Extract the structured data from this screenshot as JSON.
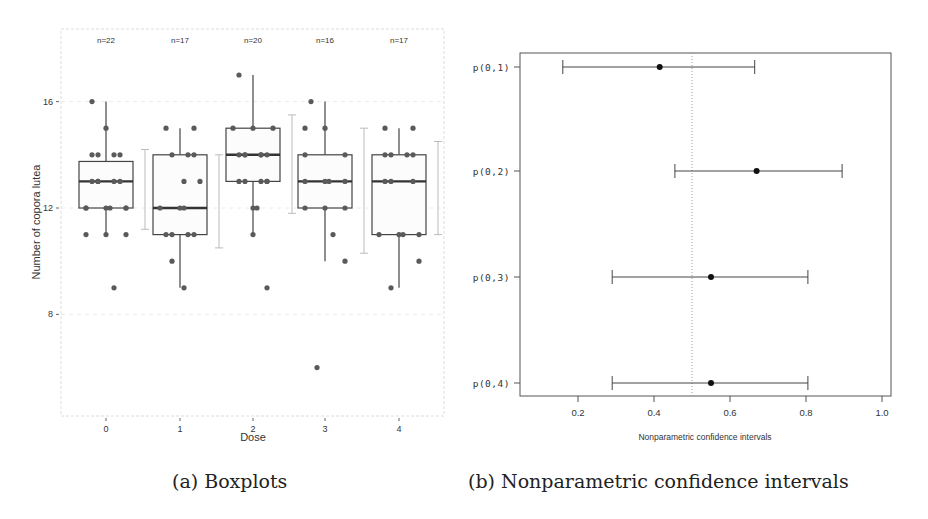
{
  "chart_data": [
    {
      "type": "boxplot",
      "title": "",
      "caption": "(a) Boxplots",
      "xlabel": "Dose",
      "ylabel": "Number of copora lutea",
      "categories": [
        "0",
        "1",
        "2",
        "3",
        "4"
      ],
      "y_ticks": [
        "8",
        "12",
        "16"
      ],
      "ylim": [
        5,
        18.5
      ],
      "grid": true,
      "annotations": [
        "n=22",
        "n=17",
        "n=20",
        "n=16",
        "n=17"
      ],
      "boxes": [
        {
          "dose": "0",
          "n": 22,
          "q1": 12,
          "median": 13,
          "q3": 13.75,
          "whisker_low": 11,
          "whisker_high": 16,
          "ci_low": 11.2,
          "ci_high": 14.2
        },
        {
          "dose": "1",
          "n": 17,
          "q1": 11,
          "median": 12,
          "q3": 14,
          "whisker_low": 9,
          "whisker_high": 15,
          "ci_low": 10.5,
          "ci_high": 14
        },
        {
          "dose": "2",
          "n": 20,
          "q1": 13,
          "median": 14,
          "q3": 15,
          "whisker_low": 11,
          "whisker_high": 17,
          "ci_low": 11.8,
          "ci_high": 15.5
        },
        {
          "dose": "3",
          "n": 16,
          "q1": 12,
          "median": 13,
          "q3": 14,
          "whisker_low": 10,
          "whisker_high": 16,
          "ci_low": 10.3,
          "ci_high": 15
        },
        {
          "dose": "4",
          "n": 17,
          "q1": 11,
          "median": 13,
          "q3": 14,
          "whisker_low": 9,
          "whisker_high": 15,
          "ci_low": 11,
          "ci_high": 14.5
        }
      ],
      "points": [
        {
          "dose": "0",
          "values": [
            16,
            15,
            14,
            14,
            14,
            14,
            13,
            13,
            13,
            13,
            13,
            12,
            12,
            12,
            12,
            12,
            12,
            11,
            11,
            11,
            9
          ]
        },
        {
          "dose": "1",
          "values": [
            15,
            15,
            14,
            14,
            14,
            13,
            13,
            12,
            12,
            12,
            11,
            11,
            11,
            11,
            10,
            9
          ]
        },
        {
          "dose": "2",
          "values": [
            17,
            15,
            15,
            15,
            14,
            14,
            14,
            14,
            14,
            14,
            13,
            13,
            13,
            13,
            13,
            12,
            12,
            11,
            9
          ]
        },
        {
          "dose": "3",
          "values": [
            16,
            15,
            15,
            14,
            14,
            13,
            13,
            13,
            13,
            12,
            12,
            12,
            11,
            10,
            6
          ]
        },
        {
          "dose": "4",
          "values": [
            15,
            15,
            14,
            14,
            14,
            14,
            13,
            13,
            13,
            11,
            11,
            11,
            11,
            10,
            9
          ]
        }
      ]
    },
    {
      "type": "errorbar",
      "title": "",
      "caption": "(b) Nonparametric confidence intervals",
      "xlabel": "Nonparametric confidence intervals",
      "ylabel": "",
      "categories": [
        "p(0,1)",
        "p(0,2)",
        "p(0,3)",
        "p(0,4)"
      ],
      "x_ticks": [
        "0.2",
        "0.4",
        "0.6",
        "0.8",
        "1.0"
      ],
      "xlim": [
        0.05,
        1.0
      ],
      "reference_line": 0.5,
      "series": [
        {
          "name": "p(0,1)",
          "estimate": 0.415,
          "lower": 0.16,
          "upper": 0.665
        },
        {
          "name": "p(0,2)",
          "estimate": 0.67,
          "lower": 0.455,
          "upper": 0.895
        },
        {
          "name": "p(0,3)",
          "estimate": 0.55,
          "lower": 0.29,
          "upper": 0.805
        },
        {
          "name": "p(0,4)",
          "estimate": 0.55,
          "lower": 0.29,
          "upper": 0.805
        }
      ]
    }
  ],
  "colors": {
    "box_line": "#444444",
    "point": "#5a5a5a",
    "ci_bar": "#bbbbbb",
    "grid": "#ececec",
    "frame": "#555555",
    "text": "#333333"
  }
}
